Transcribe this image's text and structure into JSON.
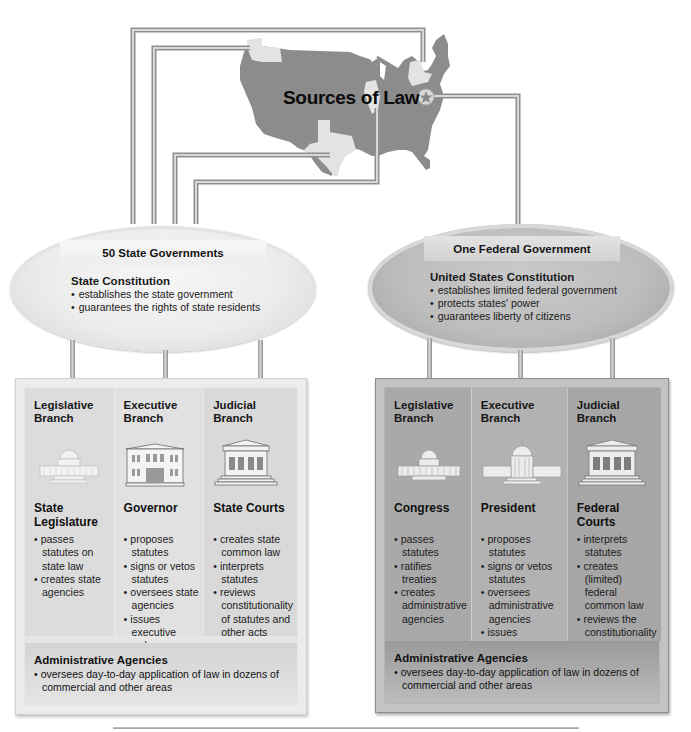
{
  "title": "Sources of Law",
  "colors": {
    "map_fill": "#8c8c8c",
    "highlight_state": "#e4e4e4",
    "rod": "#b8b8b8",
    "state_panel": "#e6e6e6",
    "federal_panel": "#b5b5b5"
  },
  "state": {
    "heading": "50 State Governments",
    "constitution": {
      "title": "State Constitution",
      "bullets": [
        "establishes the state government",
        "guarantees the rights of state residents"
      ]
    },
    "branches": [
      {
        "title": "Legislative Branch",
        "icon": "capitol-dome-icon",
        "office": "State Legislature",
        "bullets": [
          "passes statutes on state law",
          "creates state agencies"
        ]
      },
      {
        "title": "Executive Branch",
        "icon": "government-building-icon",
        "office": "Governor",
        "bullets": [
          "proposes statutes",
          "signs or vetos statutes",
          "oversees state agencies",
          "issues executive orders"
        ]
      },
      {
        "title": "Judicial Branch",
        "icon": "courthouse-icon",
        "office": "State Courts",
        "bullets": [
          "creates state common law",
          "interprets statutes",
          "reviews constitutionality of statutes and other acts"
        ]
      }
    ],
    "agencies": {
      "title": "Administrative Agencies",
      "bullet": "oversees day-to-day application of law in dozens of commercial and other areas"
    }
  },
  "federal": {
    "heading": "One Federal Government",
    "constitution": {
      "title": "United States Constitution",
      "bullets": [
        "establishes limited federal government",
        "protects states' power",
        "guarantees liberty of citizens"
      ]
    },
    "branches": [
      {
        "title": "Legislative Branch",
        "icon": "capitol-dome-icon",
        "office": "Congress",
        "bullets": [
          "passes statutes",
          "ratifies treaties",
          "creates administrative agencies"
        ]
      },
      {
        "title": "Executive Branch",
        "icon": "white-house-icon",
        "office": "President",
        "bullets": [
          "proposes statutes",
          "signs or vetos statutes",
          "oversees administrative agencies",
          "issues executive orders"
        ]
      },
      {
        "title": "Judicial Branch",
        "icon": "courthouse-icon",
        "office": "Federal Courts",
        "bullets": [
          "interprets statutes",
          "creates (limited) federal common law",
          "reviews the constitutionality of statutes and other legal acts"
        ]
      }
    ],
    "agencies": {
      "title": "Administrative Agencies",
      "bullet": "oversees day-to-day application of law in dozens of commercial and other areas"
    }
  }
}
